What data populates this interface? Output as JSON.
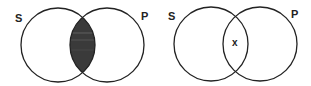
{
  "diagrams": [
    {
      "name": "venn-left",
      "type": "venn",
      "description": "Two overlapping circles S and P with the intersection shaded (empty region)",
      "circles": [
        {
          "label": "S",
          "cx": 58,
          "cy": 45,
          "r": 37
        },
        {
          "label": "P",
          "cx": 107,
          "cy": 45,
          "r": 37
        }
      ],
      "labels": {
        "left": "S",
        "right": "P"
      },
      "intersection": {
        "style": "shaded",
        "fill": "#3a3a3a",
        "mark": ""
      }
    },
    {
      "name": "venn-right",
      "type": "venn",
      "description": "Two overlapping circles S and P with an x marked in the intersection (non-empty region)",
      "circles": [
        {
          "label": "S",
          "cx": 211,
          "cy": 44,
          "r": 37
        },
        {
          "label": "P",
          "cx": 260,
          "cy": 44,
          "r": 37
        }
      ],
      "labels": {
        "left": "S",
        "right": "P"
      },
      "intersection": {
        "style": "marked",
        "fill": "none",
        "mark": "x"
      }
    }
  ],
  "colors": {
    "stroke": "#222222",
    "shade": "#3a3a3a",
    "shade_stripe": "#6a6a6a",
    "background": "#ffffff"
  }
}
